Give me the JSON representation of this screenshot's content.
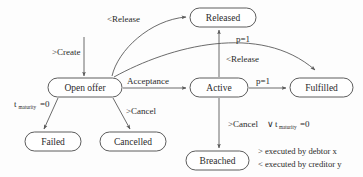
{
  "diagram": {
    "type": "state-machine",
    "nodes": [
      {
        "id": "open_offer",
        "label": "Open offer",
        "x": 48,
        "y": 78,
        "w": 74,
        "h": 19
      },
      {
        "id": "released",
        "label": "Released",
        "x": 190,
        "y": 8,
        "w": 66,
        "h": 19
      },
      {
        "id": "active",
        "label": "Active",
        "x": 190,
        "y": 78,
        "w": 58,
        "h": 19
      },
      {
        "id": "fulfilled",
        "label": "Fulfilled",
        "x": 290,
        "y": 78,
        "w": 63,
        "h": 19
      },
      {
        "id": "failed",
        "label": "Failed",
        "x": 25,
        "y": 132,
        "w": 56,
        "h": 19
      },
      {
        "id": "cancelled",
        "label": "Cancelled",
        "x": 100,
        "y": 132,
        "w": 66,
        "h": 19
      },
      {
        "id": "breached",
        "label": "Breached",
        "x": 186,
        "y": 151,
        "w": 63,
        "h": 19
      }
    ],
    "edges": [
      {
        "id": "create",
        "from": "start",
        "to": "open_offer",
        "label": ">Create"
      },
      {
        "id": "offer_release",
        "from": "open_offer",
        "to": "released",
        "label": "<Release"
      },
      {
        "id": "offer_fulfil",
        "from": "open_offer",
        "to": "fulfilled",
        "label": "p=1"
      },
      {
        "id": "offer_fail",
        "from": "open_offer",
        "to": "failed",
        "label": "t",
        "label_sub": "maturity",
        "label_tail": "=0"
      },
      {
        "id": "offer_cancel",
        "from": "open_offer",
        "to": "cancelled",
        "label": ">Cancel"
      },
      {
        "id": "acceptance",
        "from": "open_offer",
        "to": "active",
        "label": "Acceptance"
      },
      {
        "id": "active_release",
        "from": "active",
        "to": "released",
        "label": "<Release"
      },
      {
        "id": "active_fulfil",
        "from": "active",
        "to": "fulfilled",
        "label": "p=1"
      },
      {
        "id": "active_breach",
        "from": "active",
        "to": "breached",
        "label": ">Cancel ∨ ",
        "label_sub2": "t",
        "label_sub": "maturity",
        "label_tail": "=0"
      }
    ],
    "labels": {
      "create": ">Create",
      "release_offer": "<Release",
      "acceptance": "Acceptance",
      "cancel_offer": ">Cancel",
      "p_equals_one_top": "p=1",
      "p_equals_one_mid": "p=1",
      "release_active": "<Release",
      "maturity_var": "t",
      "maturity_sub": "maturity",
      "maturity_eq": "=0",
      "breach_prefix": ">Cancel",
      "breach_or": "∨",
      "breach_tail": "=0"
    },
    "legend": [
      "> executed by debtor x",
      "< executed by creditor y"
    ],
    "colors": {
      "background": "#fdfdfd",
      "node_fill": "#ffffff",
      "node_stroke": "#4a4a4a",
      "edge_stroke": "#5a5a5a",
      "text": "#2b2b2b"
    }
  }
}
